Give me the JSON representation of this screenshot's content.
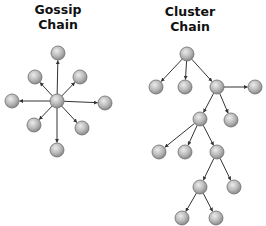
{
  "diagrams": {
    "gossip": {
      "title_line1": "Gossip",
      "title_line2": "Chain",
      "node_radius": 7,
      "nodes": [
        {
          "id": "c",
          "x": 57,
          "y": 101
        },
        {
          "id": "top",
          "x": 58,
          "y": 53
        },
        {
          "id": "ul",
          "x": 35,
          "y": 77
        },
        {
          "id": "ur",
          "x": 80,
          "y": 77
        },
        {
          "id": "l",
          "x": 12,
          "y": 101
        },
        {
          "id": "r",
          "x": 105,
          "y": 103
        },
        {
          "id": "ll",
          "x": 34,
          "y": 125
        },
        {
          "id": "lr",
          "x": 82,
          "y": 128
        },
        {
          "id": "b",
          "x": 57,
          "y": 150
        }
      ],
      "edges": [
        [
          "c",
          "top"
        ],
        [
          "c",
          "ul"
        ],
        [
          "c",
          "ur"
        ],
        [
          "c",
          "l"
        ],
        [
          "c",
          "r"
        ],
        [
          "c",
          "ll"
        ],
        [
          "c",
          "lr"
        ],
        [
          "c",
          "b"
        ]
      ]
    },
    "cluster": {
      "title_line1": "Cluster",
      "title_line2": "Chain",
      "node_radius": 7,
      "nodes": [
        {
          "id": "root",
          "x": 187,
          "y": 54
        },
        {
          "id": "a1",
          "x": 156,
          "y": 87
        },
        {
          "id": "a2",
          "x": 185,
          "y": 87
        },
        {
          "id": "a3",
          "x": 217,
          "y": 87
        },
        {
          "id": "a4",
          "x": 255,
          "y": 87
        },
        {
          "id": "b1",
          "x": 200,
          "y": 119
        },
        {
          "id": "b2",
          "x": 231,
          "y": 120
        },
        {
          "id": "c1",
          "x": 159,
          "y": 152
        },
        {
          "id": "c2",
          "x": 185,
          "y": 152
        },
        {
          "id": "c3",
          "x": 217,
          "y": 152
        },
        {
          "id": "d1",
          "x": 200,
          "y": 187
        },
        {
          "id": "d2",
          "x": 234,
          "y": 187
        },
        {
          "id": "e1",
          "x": 182,
          "y": 218
        },
        {
          "id": "e2",
          "x": 216,
          "y": 218
        }
      ],
      "edges": [
        [
          "root",
          "a1"
        ],
        [
          "root",
          "a2"
        ],
        [
          "root",
          "a3"
        ],
        [
          "a3",
          "a4"
        ],
        [
          "a3",
          "b1"
        ],
        [
          "a3",
          "b2"
        ],
        [
          "b1",
          "c1"
        ],
        [
          "b1",
          "c2"
        ],
        [
          "b1",
          "c3"
        ],
        [
          "c3",
          "d1"
        ],
        [
          "c3",
          "d2"
        ],
        [
          "d1",
          "e1"
        ],
        [
          "d1",
          "e2"
        ]
      ]
    }
  },
  "colors": {
    "node_fill_light": "#e2e2e2",
    "node_fill_dark": "#8e8e8e",
    "node_stroke": "#6e6e6e",
    "edge": "#333333"
  }
}
